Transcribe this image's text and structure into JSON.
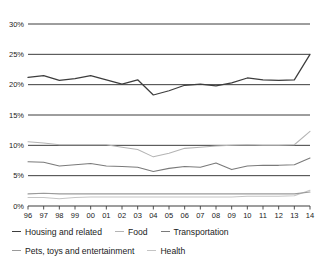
{
  "chart_data": {
    "type": "line",
    "title": "",
    "subtitle": "",
    "xlabel": "",
    "ylabel": "",
    "xlim": [
      0,
      18
    ],
    "ylim": [
      0,
      30
    ],
    "grid": true,
    "grid_axis": "y",
    "legend_position": "bottom-left",
    "x": [
      "96",
      "97",
      "98",
      "99",
      "00",
      "01",
      "02",
      "03",
      "04",
      "05",
      "06",
      "07",
      "08",
      "09",
      "10",
      "11",
      "12",
      "13",
      "14"
    ],
    "categories": [
      "96",
      "97",
      "98",
      "99",
      "00",
      "01",
      "02",
      "03",
      "04",
      "05",
      "06",
      "07",
      "08",
      "09",
      "10",
      "11",
      "12",
      "13",
      "14"
    ],
    "yticks": [
      0,
      5,
      10,
      15,
      20,
      25,
      30
    ],
    "ytick_labels": [
      "0%",
      "5%",
      "10%",
      "15%",
      "20%",
      "25%",
      "30%"
    ],
    "series": [
      {
        "name": "Housing and related",
        "color": "#3d3d3d",
        "values": [
          21.2,
          21.5,
          20.7,
          21.0,
          21.5,
          20.8,
          20.1,
          20.8,
          18.3,
          19.0,
          19.9,
          20.1,
          19.8,
          20.3,
          21.1,
          20.8,
          20.7,
          20.8,
          25.0
        ]
      },
      {
        "name": "Food",
        "color": "#b4b4b4",
        "values": [
          10.6,
          10.4,
          10.1,
          10.1,
          10.1,
          10.1,
          9.7,
          9.3,
          8.1,
          8.7,
          9.5,
          9.7,
          9.9,
          10.0,
          10.1,
          10.0,
          10.0,
          10.1,
          12.3
        ]
      },
      {
        "name": "Transportation",
        "color": "#7a7a7a",
        "values": [
          7.3,
          7.2,
          6.6,
          6.8,
          7.0,
          6.6,
          6.5,
          6.4,
          5.7,
          6.2,
          6.5,
          6.4,
          7.1,
          6.0,
          6.6,
          6.7,
          6.7,
          6.8,
          7.9
        ]
      },
      {
        "name": "Pets, toys and entertainment",
        "color": "#9a9a9a",
        "values": [
          2.0,
          2.1,
          2.0,
          2.0,
          2.0,
          2.0,
          2.0,
          2.0,
          2.0,
          2.0,
          2.0,
          2.0,
          2.0,
          2.0,
          2.0,
          2.0,
          2.0,
          2.0,
          2.3
        ]
      },
      {
        "name": "Health",
        "color": "#c4c4c4",
        "values": [
          1.4,
          1.4,
          1.2,
          1.4,
          1.5,
          1.5,
          1.5,
          1.5,
          1.5,
          1.5,
          1.5,
          1.5,
          1.5,
          1.5,
          1.6,
          1.6,
          1.6,
          1.7,
          2.6
        ]
      }
    ]
  },
  "legend": {
    "rows": [
      [
        {
          "label": "Housing and related",
          "color": "#3d3d3d"
        },
        {
          "label": "Food",
          "color": "#b4b4b4"
        },
        {
          "label": "Transportation",
          "color": "#7a7a7a"
        }
      ],
      [
        {
          "label": "Pets, toys and entertainment",
          "color": "#9a9a9a"
        },
        {
          "label": "Health",
          "color": "#c4c4c4"
        }
      ]
    ]
  },
  "colors": {
    "gridline": "#3d3d3d",
    "axis": "#3d3d3d",
    "text": "#1a1a1a",
    "background": "#ffffff"
  }
}
